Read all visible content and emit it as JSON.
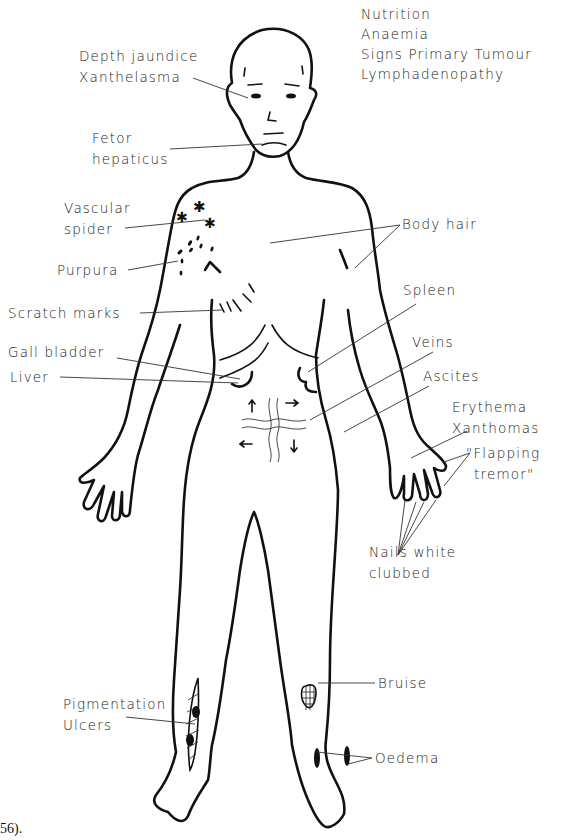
{
  "figure": {
    "type": "clinical-signs-body-diagram",
    "caption_fragment": "56).",
    "colors": {
      "ink": "#111111",
      "label_text": "#222222",
      "background": "#ffffff"
    }
  },
  "labels": {
    "general": [
      "Nutrition",
      "Anaemia",
      "Signs Primary Tumour",
      "Lymphadenopathy"
    ],
    "depth_jaundice": "Depth jaundice",
    "xanthelasma": "Xanthelasma",
    "fetor_1": "Fetor",
    "fetor_2": "hepaticus",
    "vascular_1": "Vascular",
    "vascular_2": "spider",
    "purpura": "Purpura",
    "scratch_marks": "Scratch marks",
    "gall_bladder": "Gall bladder",
    "liver": "Liver",
    "body_hair": "Body hair",
    "spleen": "Spleen",
    "veins": "Veins",
    "ascites": "Ascites",
    "erythema": "Erythema",
    "xanthomas": "Xanthomas",
    "flapping_1": "\"Flapping",
    "flapping_2": "tremor\"",
    "nails_1": "Nails white",
    "nails_2": "clubbed",
    "bruise": "Bruise",
    "pigmentation": "Pigmentation",
    "ulcers": "Ulcers",
    "oedema": "Oedema"
  }
}
